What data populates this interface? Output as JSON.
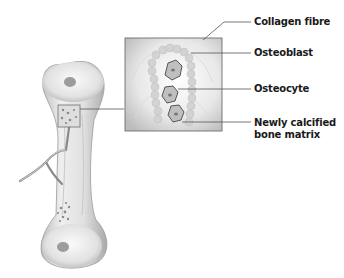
{
  "diagram": {
    "labels": [
      {
        "id": "collagen",
        "text": "Collagen fibre"
      },
      {
        "id": "osteoblast",
        "text": "Osteoblast"
      },
      {
        "id": "osteocyte",
        "text": "Osteocyte"
      },
      {
        "id": "matrix_line1",
        "text": "Newly calcified"
      },
      {
        "id": "matrix_line2",
        "text": "bone matrix"
      }
    ],
    "colors": {
      "background": "#ffffff",
      "bone_light": "#f2f2f2",
      "bone_shade": "#bdbdbd",
      "leader_line": "#555555",
      "inset_border": "#6e6e6e",
      "label_text": "#1a1a1a"
    }
  }
}
